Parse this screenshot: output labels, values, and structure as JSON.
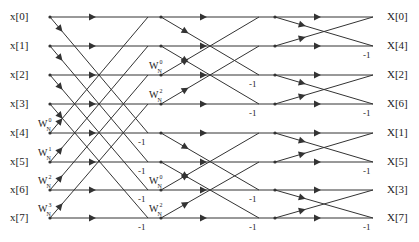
{
  "colors": {
    "line": "#333333",
    "text": "#222222",
    "background": "#ffffff"
  },
  "inputs": [
    "x[0]",
    "x[1]",
    "x[2]",
    "x[3]",
    "x[4]",
    "x[5]",
    "x[6]",
    "x[7]"
  ],
  "outputs": [
    "X[0]",
    "X[4]",
    "X[2]",
    "X[6]",
    "X[1]",
    "X[5]",
    "X[3]",
    "X[7]"
  ],
  "rows_y": [
    17,
    46,
    75,
    104,
    133,
    162,
    190,
    218
  ],
  "stages": [
    {
      "name": "stage-1",
      "x0": 50,
      "x1": 148,
      "span": 4,
      "twiddles": [
        {
          "row": 4,
          "base": "W",
          "sup": "0",
          "sub": "N"
        },
        {
          "row": 5,
          "base": "W",
          "sup": "1",
          "sub": "N"
        },
        {
          "row": 6,
          "base": "W",
          "sup": "2",
          "sub": "N"
        },
        {
          "row": 7,
          "base": "W",
          "sup": "3",
          "sub": "N"
        }
      ],
      "negs": [
        4,
        5,
        6,
        7
      ]
    },
    {
      "name": "stage-2",
      "x0": 161,
      "x1": 259,
      "span": 2,
      "twiddles": [
        {
          "row": 2,
          "base": "W",
          "sup": "0",
          "sub": "N"
        },
        {
          "row": 3,
          "base": "W",
          "sup": "2",
          "sub": "N"
        },
        {
          "row": 6,
          "base": "W",
          "sup": "0",
          "sub": "N"
        },
        {
          "row": 7,
          "base": "W",
          "sup": "2",
          "sub": "N"
        }
      ],
      "negs": [
        2,
        3,
        6,
        7
      ]
    },
    {
      "name": "stage-3",
      "x0": 275,
      "x1": 373,
      "span": 1,
      "twiddles": [],
      "negs": [
        1,
        3,
        5,
        7
      ]
    }
  ],
  "neg_label": "-1",
  "output_x_end": 373
}
